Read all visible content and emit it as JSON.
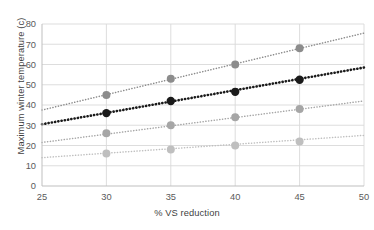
{
  "chart_data": {
    "type": "line",
    "title": "",
    "xlabel": "% VS reduction",
    "ylabel": "Maximum winter temperature (c)",
    "xlim": [
      25,
      50
    ],
    "ylim": [
      0,
      80
    ],
    "xticks": [
      25,
      30,
      35,
      40,
      45,
      50
    ],
    "yticks": [
      0,
      10,
      20,
      30,
      40,
      50,
      60,
      70,
      80
    ],
    "grid": true,
    "legend": "none",
    "x": [
      30,
      35,
      40,
      45
    ],
    "series": [
      {
        "name": "series-1",
        "color": "#8c8c8c",
        "linestyle": "dotted",
        "values": [
          45,
          53,
          60,
          68
        ],
        "fit_start": [
          25,
          37.5
        ],
        "fit_end": [
          50,
          75.5
        ]
      },
      {
        "name": "series-2",
        "color": "#1a1a1a",
        "linestyle": "dotted",
        "values": [
          36,
          42,
          46.5,
          52.5
        ],
        "fit_start": [
          25,
          30.5
        ],
        "fit_end": [
          50,
          58.5
        ]
      },
      {
        "name": "series-3",
        "color": "#a6a6a6",
        "linestyle": "dotted",
        "values": [
          26,
          30,
          34,
          38
        ],
        "fit_start": [
          25,
          21.5
        ],
        "fit_end": [
          50,
          42.0
        ]
      },
      {
        "name": "series-4",
        "color": "#bfbfbf",
        "linestyle": "dotted",
        "values": [
          16,
          18,
          20,
          22
        ],
        "fit_start": [
          25,
          14.0
        ],
        "fit_end": [
          50,
          25.0
        ]
      }
    ]
  },
  "axes": {
    "xtick_labels": [
      "25",
      "30",
      "35",
      "40",
      "45",
      "50"
    ],
    "ytick_labels": [
      "0",
      "10",
      "20",
      "30",
      "40",
      "50",
      "60",
      "70",
      "80"
    ]
  },
  "style": {
    "grid_color": "#d9d9d9",
    "axis_color": "#bfbfbf",
    "background": "#ffffff"
  }
}
